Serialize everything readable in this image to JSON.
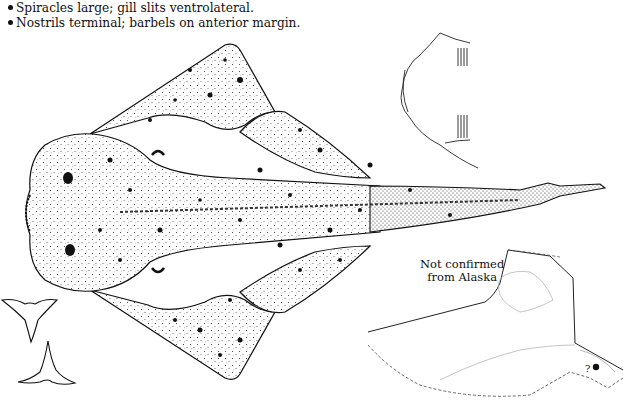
{
  "bullets": [
    "Spiracles large; gill slits ventrolateral.",
    "Nostrils terminal; barbels on anterior margin."
  ],
  "map": {
    "label_line1": "Not confirmed",
    "label_line2": "from Alaska",
    "marker_symbol": "?"
  },
  "figures": {
    "main": "dorsal view of angel shark (spotted)",
    "head_detail": "ventral head outline with gill slits",
    "teeth": "two tooth outlines",
    "range_map": "Alaska outline with record marker"
  }
}
